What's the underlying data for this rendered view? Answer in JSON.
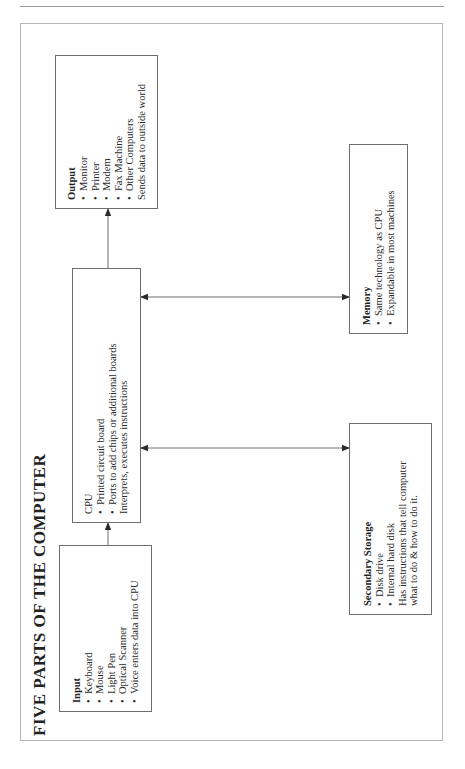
{
  "title": "FIVE PARTS OF THE COMPUTER",
  "boxes": {
    "input": {
      "title": "Input",
      "items": [
        "Keyboard",
        "Mouse",
        "Light Pen",
        "Optical Scanner",
        "Voice enters data into CPU"
      ],
      "notes": []
    },
    "cpu": {
      "title": "CPU",
      "items": [
        "Printed circuit board",
        "Ports to add chips or additional boards"
      ],
      "notes": [
        "Interprets, executes instructions"
      ]
    },
    "output": {
      "title": "Output",
      "items": [
        "Monitor",
        "Printer",
        "Modem",
        "Fax Machine",
        "Other Computers"
      ],
      "notes": [
        "Sends data to outside world"
      ]
    },
    "memory": {
      "title": "Memory",
      "items": [
        "Same technology as CPU",
        "Expandable in most machines"
      ],
      "notes": []
    },
    "secondary_storage": {
      "title": "Secondary Storage",
      "items": [
        "Disk drive",
        "Internal hard disk"
      ],
      "notes": [
        "Has instructions that tell computer",
        "what to do & how to do it."
      ]
    }
  },
  "connections": [
    {
      "from": "Input",
      "to": "CPU",
      "type": "one-way"
    },
    {
      "from": "CPU",
      "to": "Output",
      "type": "one-way"
    },
    {
      "from": "CPU",
      "to": "Memory",
      "type": "two-way"
    },
    {
      "from": "CPU",
      "to": "Secondary Storage",
      "type": "two-way"
    }
  ],
  "bullet": "•",
  "colors": {
    "line": "#6e6e6e",
    "frame": "#b5b5b5",
    "text": "#2a2a2a"
  }
}
